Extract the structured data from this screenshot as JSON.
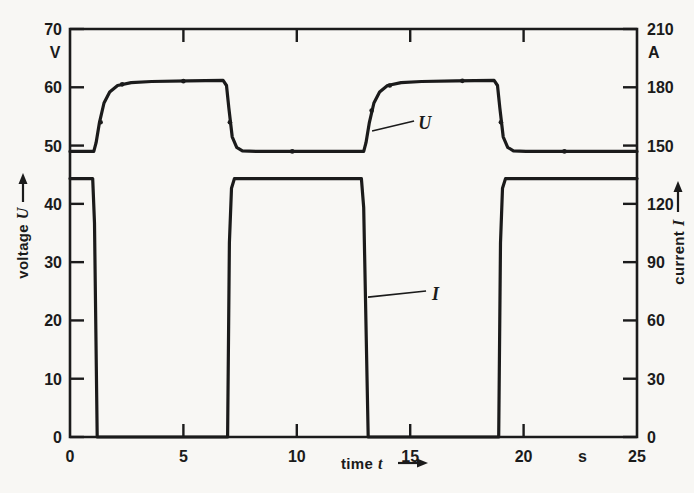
{
  "figure": {
    "background": "#f8f7f4",
    "ink": "#1b1b1b"
  },
  "chart_data": {
    "type": "line",
    "title": "",
    "x_axis": {
      "label": "time",
      "symbol": "t",
      "unit": "s",
      "range": [
        0,
        25
      ],
      "ticks": [
        0,
        5,
        10,
        15,
        20,
        25
      ],
      "inner_ticks": [
        5,
        10,
        15,
        20
      ]
    },
    "y_left": {
      "label": "voltage",
      "symbol": "U",
      "unit": "V",
      "range": [
        0,
        70
      ],
      "ticks": [
        70,
        60,
        50,
        40,
        30,
        20,
        10,
        0
      ]
    },
    "y_right": {
      "label": "current",
      "symbol": "I",
      "unit": "A",
      "range": [
        0,
        210
      ],
      "ticks": [
        210,
        180,
        150,
        120,
        90,
        60,
        30,
        0
      ]
    },
    "series": [
      {
        "name": "U",
        "axis": "left",
        "points": [
          [
            0,
            49
          ],
          [
            1.05,
            49
          ],
          [
            1.15,
            50.5
          ],
          [
            1.3,
            54
          ],
          [
            1.5,
            57.3
          ],
          [
            1.75,
            59.2
          ],
          [
            2.1,
            60.3
          ],
          [
            2.7,
            60.8
          ],
          [
            3.6,
            61
          ],
          [
            5.2,
            61.1
          ],
          [
            6.75,
            61.2
          ],
          [
            6.9,
            60.3
          ],
          [
            7.0,
            56.5
          ],
          [
            7.15,
            51.5
          ],
          [
            7.35,
            49.7
          ],
          [
            7.6,
            49.1
          ],
          [
            8.2,
            49
          ],
          [
            12.95,
            49
          ],
          [
            13.05,
            50.5
          ],
          [
            13.2,
            54
          ],
          [
            13.4,
            57.3
          ],
          [
            13.65,
            59.2
          ],
          [
            14.0,
            60.3
          ],
          [
            14.6,
            60.8
          ],
          [
            15.5,
            61
          ],
          [
            17.0,
            61.1
          ],
          [
            18.7,
            61.2
          ],
          [
            18.85,
            60.3
          ],
          [
            18.95,
            56.5
          ],
          [
            19.1,
            51.5
          ],
          [
            19.3,
            49.7
          ],
          [
            19.55,
            49.1
          ],
          [
            20.1,
            49
          ],
          [
            25,
            49
          ]
        ]
      },
      {
        "name": "I",
        "axis": "right",
        "points": [
          [
            0,
            133
          ],
          [
            1.0,
            133
          ],
          [
            1.08,
            110
          ],
          [
            1.2,
            0
          ],
          [
            6.95,
            0
          ],
          [
            7.03,
            100
          ],
          [
            7.12,
            128
          ],
          [
            7.25,
            133
          ],
          [
            12.85,
            133
          ],
          [
            12.95,
            118
          ],
          [
            13.15,
            0
          ],
          [
            18.9,
            0
          ],
          [
            18.98,
            100
          ],
          [
            19.07,
            128
          ],
          [
            19.2,
            133
          ],
          [
            25,
            133
          ]
        ]
      }
    ],
    "marker_dots_axis": "left",
    "marker_dots": [
      [
        1.35,
        54
      ],
      [
        2.3,
        60.5
      ],
      [
        5.0,
        61.05
      ],
      [
        7.05,
        54
      ],
      [
        9.8,
        49
      ],
      [
        13.3,
        56
      ],
      [
        14.1,
        60.3
      ],
      [
        17.3,
        61.1
      ],
      [
        19.0,
        54
      ],
      [
        21.8,
        49
      ]
    ],
    "annotations": [
      {
        "text": "U",
        "text_at": [
          15.35,
          52.9
        ],
        "leader": [
          [
            13.32,
            52.5
          ],
          [
            15.17,
            54.2
          ]
        ]
      },
      {
        "text": "I",
        "text_at": [
          15.96,
          23.5
        ],
        "leader": [
          [
            13.14,
            24.0
          ],
          [
            15.7,
            25.05
          ]
        ]
      }
    ]
  }
}
